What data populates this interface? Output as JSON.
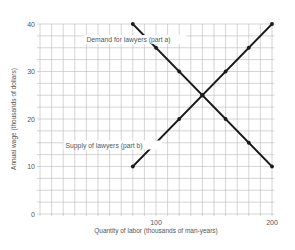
{
  "chart_data": {
    "type": "line",
    "title": "",
    "xlabel": "Quantity of labor (thousands of man-years)",
    "ylabel": "Annual wage (thousands of dollars)",
    "xlim": [
      0,
      200
    ],
    "ylim": [
      0,
      40
    ],
    "x_ticks": [
      100,
      200
    ],
    "y_ticks": [
      0,
      10,
      20,
      30,
      40
    ],
    "grid": true,
    "grid_x_step": 10,
    "grid_y_step": 2.5,
    "series": [
      {
        "name": "Demand for lawyers (part a)",
        "x": [
          80,
          100,
          120,
          140,
          160,
          180,
          200
        ],
        "values": [
          40,
          35,
          30,
          25,
          20,
          15,
          10
        ],
        "label_pos": {
          "x": 40,
          "y": 36.2
        }
      },
      {
        "name": "Supply of lawyers (part b)",
        "x": [
          80,
          100,
          120,
          140,
          160,
          180,
          200
        ],
        "values": [
          10,
          15,
          20,
          25,
          30,
          35,
          40
        ],
        "label_pos": {
          "x": 22,
          "y": 14
        }
      }
    ],
    "annotations": [
      "Demand for lawyers (part a)",
      "Supply of lawyers (part b)"
    ],
    "line_color": "#1a1a1a",
    "grid_color": "#b8b8b8"
  }
}
